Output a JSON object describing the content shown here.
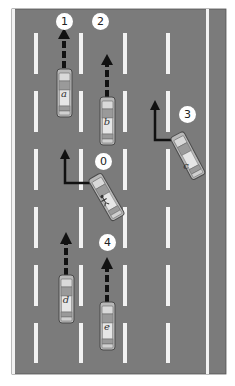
{
  "diagram": {
    "type": "highway-lane-change-scenario",
    "colors": {
      "road": "#7b7b7b",
      "lane_marking": "#f2f2f2",
      "car_body": "#b5b5b5",
      "car_outline": "#4a4a4a",
      "arrow": "#111111",
      "marker_fill": "#ffffff"
    },
    "markers": [
      {
        "id": "1",
        "label": "1"
      },
      {
        "id": "2",
        "label": "2"
      },
      {
        "id": "3",
        "label": "3"
      },
      {
        "id": "0",
        "label": "0"
      },
      {
        "id": "4",
        "label": "4"
      }
    ],
    "vehicles": [
      {
        "id": "a",
        "label": "a",
        "action": "straight"
      },
      {
        "id": "b",
        "label": "b",
        "action": "straight"
      },
      {
        "id": "c",
        "label": "c",
        "action": "lane-change-left"
      },
      {
        "id": "ego",
        "label": "",
        "action": "lane-change-left",
        "icon": "driver-icon"
      },
      {
        "id": "d",
        "label": "d",
        "action": "straight"
      },
      {
        "id": "e",
        "label": "e",
        "action": "straight"
      }
    ]
  }
}
